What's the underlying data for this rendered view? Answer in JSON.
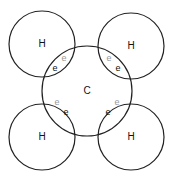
{
  "diagram": {
    "title": "",
    "center_atom": {
      "label": "C",
      "cx": 87,
      "cy": 91,
      "r": 45
    },
    "hydrogens": [
      {
        "label": "H",
        "cx": 42,
        "cy": 44,
        "r": 33,
        "e_dark": {
          "label": "e",
          "x": 55,
          "y": 69
        },
        "e_light": {
          "label": "e",
          "x": 64,
          "y": 59
        }
      },
      {
        "label": "H",
        "cx": 131,
        "cy": 46,
        "r": 33,
        "e_dark": {
          "label": "e",
          "x": 118,
          "y": 69
        },
        "e_light": {
          "label": "e",
          "x": 109,
          "y": 59
        }
      },
      {
        "label": "H",
        "cx": 42,
        "cy": 137,
        "r": 33,
        "e_dark": {
          "label": "e",
          "x": 66,
          "y": 113
        },
        "e_light": {
          "label": "e",
          "x": 57,
          "y": 103
        }
      },
      {
        "label": "H",
        "cx": 131,
        "cy": 137,
        "r": 33,
        "e_dark": {
          "label": "e",
          "x": 108,
          "y": 113
        },
        "e_light": {
          "label": "e",
          "x": 117,
          "y": 103
        }
      }
    ]
  }
}
